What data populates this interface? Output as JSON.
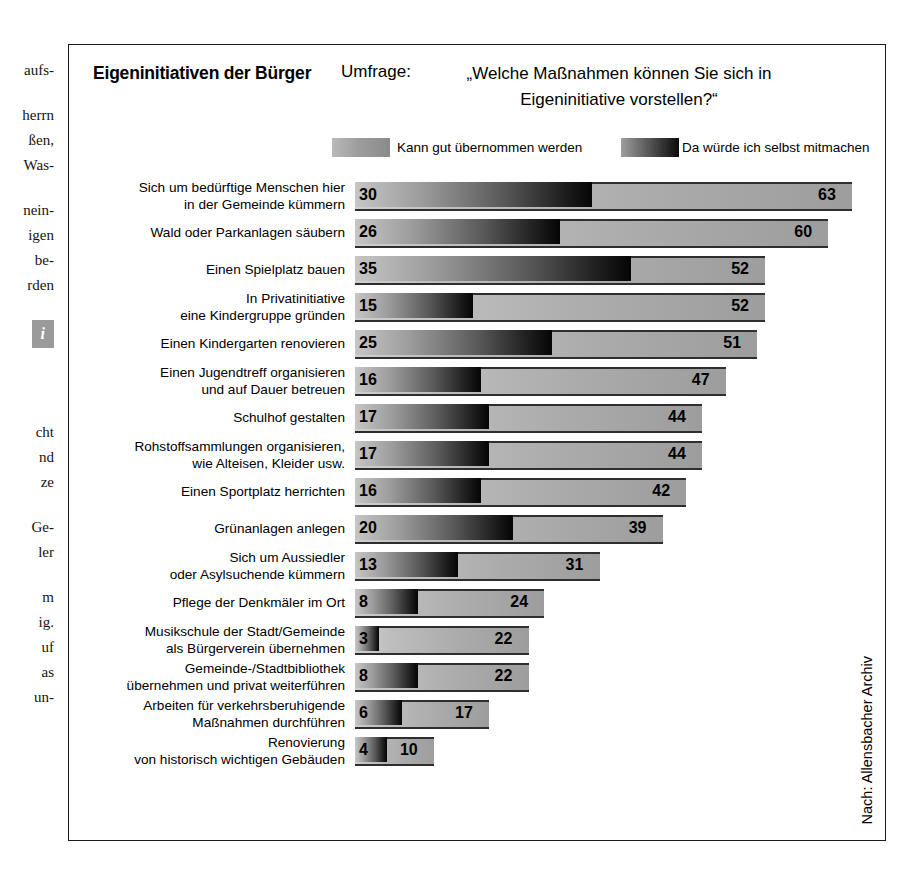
{
  "article_column": {
    "paragraphs": [
      [
        "aufs-"
      ],
      [
        "herrn",
        "ßen,",
        "Was-"
      ],
      [
        "nein-",
        "igen",
        "be-",
        "rden"
      ]
    ],
    "info_badge": "i",
    "paragraphs_lower": [
      [
        "cht",
        "nd",
        "ze"
      ],
      [
        "Ge-",
        "ler"
      ],
      [
        "m",
        "ig.",
        "uf",
        "as",
        "un-"
      ]
    ]
  },
  "chart": {
    "title": "Eigeninitiativen der Bürger",
    "survey_label": "Umfrage:",
    "survey_question": "„Welche Maßnahmen können Sie sich in Eigeninitiative vorstellen?“",
    "source": "Nach: Allensbacher Archiv"
  },
  "legend": {
    "light_label": "Kann gut übernommen werden",
    "dark_label": "Da würde ich selbst mitmachen",
    "light_color": "#ababab",
    "dark_color": "#141414"
  },
  "chart_data": {
    "type": "bar",
    "orientation": "horizontal",
    "title": "Eigeninitiativen der Bürger",
    "subtitle": "Umfrage: „Welche Maßnahmen können Sie sich in Eigeninitiative vorstellen?“",
    "xlabel": "",
    "ylabel": "",
    "units": "Prozent",
    "xlim": [
      0,
      63
    ],
    "grid": false,
    "legend_position": "top",
    "source": "Nach: Allensbacher Archiv",
    "categories": [
      "Sich um bedürftige Menschen hier\nin der Gemeinde kümmern",
      "Wald oder Parkanlagen säubern",
      "Einen Spielplatz bauen",
      "In Privatinitiative\neine Kindergruppe gründen",
      "Einen Kindergarten renovieren",
      "Einen Jugendtreff organisieren\nund auf Dauer betreuen",
      "Schulhof gestalten",
      "Rohstoffsammlungen organisieren,\nwie Alteisen, Kleider usw.",
      "Einen Sportplatz herrichten",
      "Grünanlagen anlegen",
      "Sich um Aussiedler\noder Asylsuchende kümmern",
      "Pflege der Denkmäler im Ort",
      "Musikschule der Stadt/Gemeinde\nals Bürgerverein übernehmen",
      "Gemeinde-/Stadtbibliothek\nübernehmen und privat weiterführen",
      "Arbeiten für verkehrsberuhigende\nMaßnahmen durchführen",
      "Renovierung\nvon historisch wichtigen Gebäuden"
    ],
    "series": [
      {
        "name": "Kann gut übernommen werden",
        "color": "#ababab",
        "values": [
          63,
          60,
          52,
          52,
          51,
          47,
          44,
          44,
          42,
          39,
          31,
          24,
          22,
          22,
          17,
          10
        ]
      },
      {
        "name": "Da würde ich selbst mitmachen",
        "color": "#141414",
        "values": [
          30,
          26,
          35,
          15,
          25,
          16,
          17,
          17,
          16,
          20,
          13,
          8,
          3,
          8,
          6,
          4
        ]
      }
    ]
  }
}
